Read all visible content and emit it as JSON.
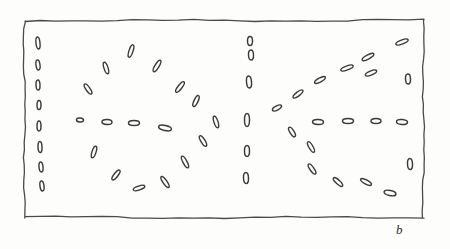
{
  "figure": {
    "kind": "hand-drawn-schematic",
    "panel_label": "b",
    "caption_text": "",
    "ink_color": "#3a3a3a",
    "frame_color": "#4a4a4a",
    "background_color": "#fdfdfc",
    "frame": {
      "x": 25,
      "y": 21,
      "width": 399,
      "height": 197
    }
  },
  "chart_data": {
    "type": "scatter",
    "title": "",
    "subtitle": "",
    "xlabel": "",
    "ylabel": "",
    "annotations": [
      "b"
    ],
    "legend": [],
    "grid": false,
    "xlim": [
      25,
      424
    ],
    "ylim": [
      21,
      218
    ],
    "marker_shape": "hollow-ellipse",
    "marker_length_px": 11,
    "marker_width_px": 4,
    "series": [
      {
        "name": "left-edge-column",
        "points": [
          {
            "x": 38,
            "y": 43,
            "angle": 84,
            "len": 12,
            "wid": 4
          },
          {
            "x": 38,
            "y": 65,
            "angle": 82,
            "len": 10,
            "wid": 4
          },
          {
            "x": 38,
            "y": 85,
            "angle": 88,
            "len": 10,
            "wid": 4
          },
          {
            "x": 39,
            "y": 105,
            "angle": 90,
            "len": 9,
            "wid": 4
          },
          {
            "x": 39,
            "y": 126,
            "angle": 90,
            "len": 10,
            "wid": 4
          },
          {
            "x": 40,
            "y": 147,
            "angle": 88,
            "len": 11,
            "wid": 4
          },
          {
            "x": 41,
            "y": 167,
            "angle": 84,
            "len": 10,
            "wid": 4
          },
          {
            "x": 42,
            "y": 186,
            "angle": 82,
            "len": 10,
            "wid": 4
          }
        ]
      },
      {
        "name": "upper-left-arc",
        "points": [
          {
            "x": 88,
            "y": 89,
            "angle": 55,
            "len": 12,
            "wid": 4
          },
          {
            "x": 106,
            "y": 68,
            "angle": 72,
            "len": 12,
            "wid": 4
          },
          {
            "x": 131,
            "y": 51,
            "angle": 108,
            "len": 13,
            "wid": 4
          },
          {
            "x": 157,
            "y": 66,
            "angle": 122,
            "len": 13,
            "wid": 4
          },
          {
            "x": 180,
            "y": 87,
            "angle": 128,
            "len": 13,
            "wid": 4
          },
          {
            "x": 196,
            "y": 101,
            "angle": 115,
            "len": 12,
            "wid": 4
          }
        ]
      },
      {
        "name": "lower-left-arc",
        "points": [
          {
            "x": 94,
            "y": 152,
            "angle": 108,
            "len": 12,
            "wid": 4
          },
          {
            "x": 116,
            "y": 175,
            "angle": 128,
            "len": 12,
            "wid": 4
          },
          {
            "x": 139,
            "y": 188,
            "angle": 162,
            "len": 12,
            "wid": 4
          },
          {
            "x": 165,
            "y": 182,
            "angle": 55,
            "len": 13,
            "wid": 4
          },
          {
            "x": 185,
            "y": 162,
            "angle": 62,
            "len": 13,
            "wid": 4
          },
          {
            "x": 203,
            "y": 141,
            "angle": 58,
            "len": 12,
            "wid": 4
          }
        ]
      },
      {
        "name": "left-midline-row",
        "points": [
          {
            "x": 80,
            "y": 120,
            "angle": 5,
            "len": 7,
            "wid": 4
          },
          {
            "x": 107,
            "y": 122,
            "angle": 2,
            "len": 10,
            "wid": 5
          },
          {
            "x": 134,
            "y": 123,
            "angle": 0,
            "len": 11,
            "wid": 5
          },
          {
            "x": 165,
            "y": 128,
            "angle": 12,
            "len": 13,
            "wid": 5
          },
          {
            "x": 216,
            "y": 122,
            "angle": 72,
            "len": 12,
            "wid": 4
          }
        ]
      },
      {
        "name": "centre-column",
        "points": [
          {
            "x": 250,
            "y": 41,
            "angle": 90,
            "len": 9,
            "wid": 5
          },
          {
            "x": 251,
            "y": 55,
            "angle": 88,
            "len": 10,
            "wid": 5
          },
          {
            "x": 249,
            "y": 82,
            "angle": 85,
            "len": 12,
            "wid": 5
          },
          {
            "x": 247,
            "y": 120,
            "angle": 90,
            "len": 13,
            "wid": 5
          },
          {
            "x": 247,
            "y": 151,
            "angle": 90,
            "len": 11,
            "wid": 5
          },
          {
            "x": 246,
            "y": 178,
            "angle": 88,
            "len": 11,
            "wid": 5
          }
        ]
      },
      {
        "name": "upper-right-ray",
        "points": [
          {
            "x": 277,
            "y": 108,
            "angle": 152,
            "len": 10,
            "wid": 4
          },
          {
            "x": 298,
            "y": 94,
            "angle": 142,
            "len": 12,
            "wid": 4
          },
          {
            "x": 320,
            "y": 80,
            "angle": 152,
            "len": 12,
            "wid": 4
          },
          {
            "x": 347,
            "y": 68,
            "angle": 160,
            "len": 13,
            "wid": 4
          },
          {
            "x": 368,
            "y": 57,
            "angle": 152,
            "len": 13,
            "wid": 4
          },
          {
            "x": 371,
            "y": 73,
            "angle": 158,
            "len": 12,
            "wid": 4
          },
          {
            "x": 402,
            "y": 42,
            "angle": 160,
            "len": 13,
            "wid": 4
          }
        ]
      },
      {
        "name": "lower-right-ray",
        "points": [
          {
            "x": 292,
            "y": 132,
            "angle": 58,
            "len": 11,
            "wid": 4
          },
          {
            "x": 311,
            "y": 147,
            "angle": 60,
            "len": 12,
            "wid": 4
          },
          {
            "x": 312,
            "y": 169,
            "angle": 55,
            "len": 12,
            "wid": 4
          },
          {
            "x": 338,
            "y": 182,
            "angle": 42,
            "len": 12,
            "wid": 4
          },
          {
            "x": 366,
            "y": 182,
            "angle": 28,
            "len": 12,
            "wid": 4
          },
          {
            "x": 390,
            "y": 193,
            "angle": 12,
            "len": 12,
            "wid": 5
          }
        ]
      },
      {
        "name": "right-midline-row",
        "points": [
          {
            "x": 318,
            "y": 122,
            "angle": 2,
            "len": 11,
            "wid": 5
          },
          {
            "x": 348,
            "y": 121,
            "angle": 0,
            "len": 11,
            "wid": 5
          },
          {
            "x": 376,
            "y": 121,
            "angle": 0,
            "len": 10,
            "wid": 5
          },
          {
            "x": 402,
            "y": 122,
            "angle": 4,
            "len": 11,
            "wid": 5
          }
        ]
      },
      {
        "name": "right-edge-column",
        "points": [
          {
            "x": 408,
            "y": 79,
            "angle": 88,
            "len": 10,
            "wid": 5
          },
          {
            "x": 410,
            "y": 164,
            "angle": 88,
            "len": 11,
            "wid": 5
          }
        ]
      }
    ]
  }
}
